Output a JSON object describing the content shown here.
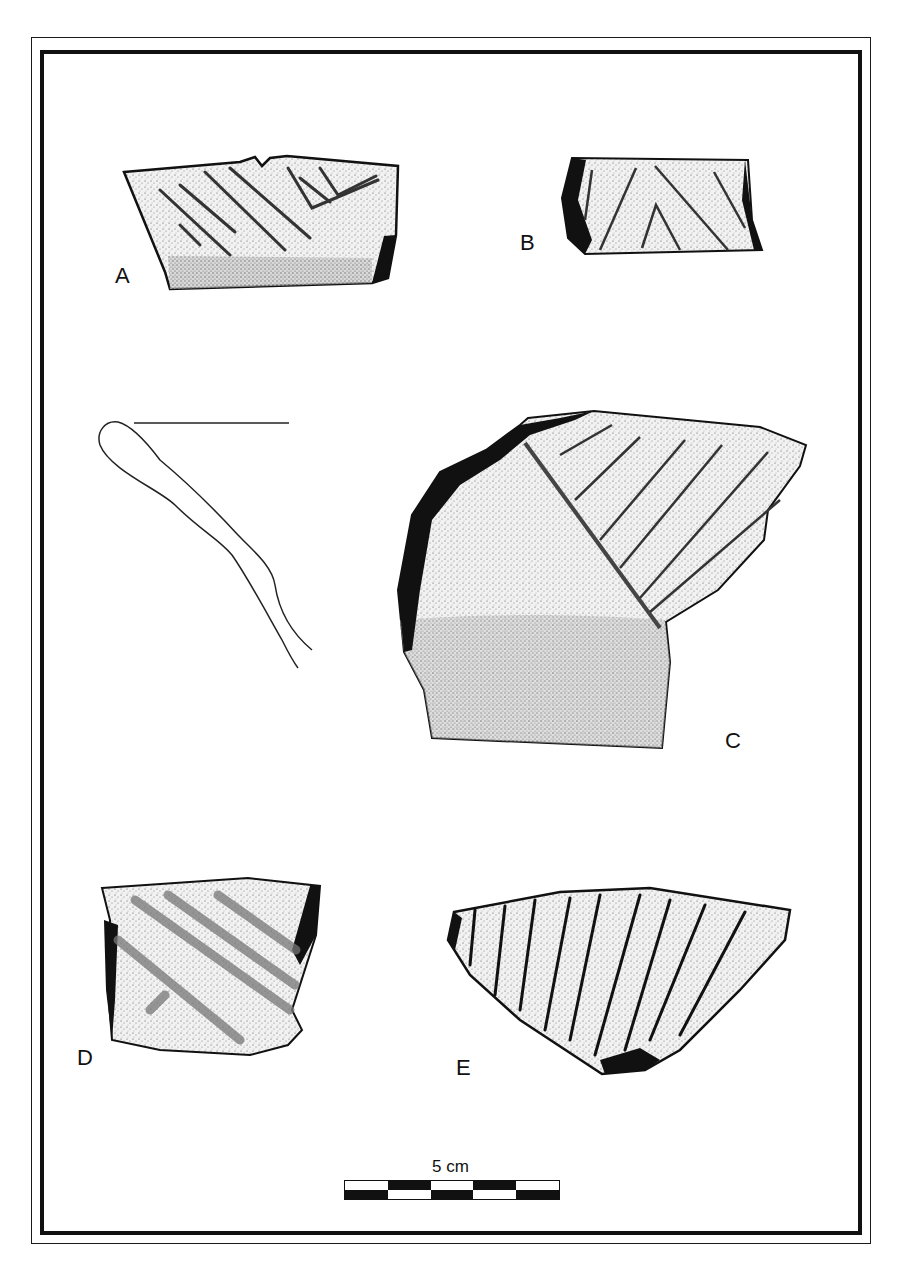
{
  "figure": {
    "type": "archaeological pottery sherd illustration plate",
    "sherds": [
      {
        "id": "A",
        "label": "A",
        "decoration": "incised diagonal lines with V-shaped chevron"
      },
      {
        "id": "B",
        "label": "B",
        "decoration": "incised lines forming nested inverted V"
      },
      {
        "id": "C",
        "label": "C",
        "decoration": "incised diagonal lines bounded by ridge, with rim profile"
      },
      {
        "id": "D",
        "label": "D",
        "decoration": "broad grooved diagonal lines"
      },
      {
        "id": "E",
        "label": "E",
        "decoration": "parallel incised diagonal lines"
      }
    ],
    "profile": {
      "label": "rim profile cross-section"
    },
    "scale": {
      "label": "5 cm",
      "segments": 5
    }
  },
  "colors": {
    "ink": "#111111",
    "paper": "#ffffff",
    "stipple": "#d9d9d9"
  }
}
